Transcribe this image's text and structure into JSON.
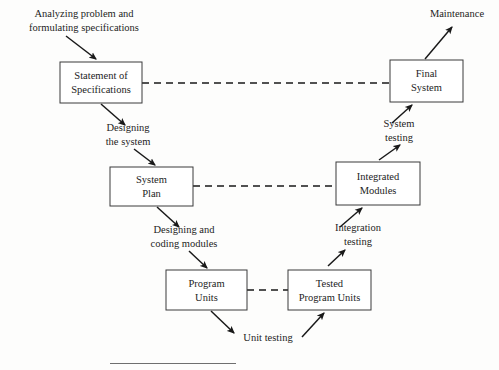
{
  "diagram": {
    "type": "flow-diagram",
    "colors": {
      "background": "#fdfdfc",
      "box_stroke": "#3a3a3a",
      "box_fill": "#ffffff",
      "text": "#1d1d1d",
      "arrow": "#191919"
    },
    "nodes": [
      {
        "id": "statement-of-specifications",
        "line1": "Statement of",
        "line2": "Specifications",
        "x": 60,
        "y": 62,
        "w": 82,
        "h": 41
      },
      {
        "id": "final-system",
        "line1": "Final",
        "line2": "System",
        "x": 390,
        "y": 60,
        "w": 73,
        "h": 42
      },
      {
        "id": "system-plan",
        "line1": "System",
        "line2": "Plan",
        "x": 110,
        "y": 167,
        "w": 83,
        "h": 39
      },
      {
        "id": "integrated-modules",
        "line1": "Integrated",
        "line2": "Modules",
        "x": 336,
        "y": 162,
        "w": 84,
        "h": 43
      },
      {
        "id": "program-units",
        "line1": "Program",
        "line2": "Units",
        "x": 166,
        "y": 270,
        "w": 81,
        "h": 40
      },
      {
        "id": "tested-program-units",
        "line1": "Tested",
        "line2": "Program Units",
        "x": 288,
        "y": 270,
        "w": 83,
        "h": 40
      }
    ],
    "edge_labels": [
      {
        "id": "analyzing-problem",
        "line1": "Analyzing problem and",
        "line2": "formulating specifications",
        "cx": 84,
        "y1": 17,
        "y2": 31
      },
      {
        "id": "designing-the-system",
        "line1": "Designing",
        "line2": "the system",
        "cx": 128,
        "y1": 131,
        "y2": 145
      },
      {
        "id": "designing-coding-modules",
        "line1": "Designing and",
        "line2": "coding modules",
        "cx": 184,
        "y1": 233,
        "y2": 247
      },
      {
        "id": "unit-testing",
        "line1": "Unit testing",
        "line2": "",
        "cx": 268,
        "y1": 341,
        "y2": 0
      },
      {
        "id": "integration-testing",
        "line1": "Integration",
        "line2": "testing",
        "cx": 358,
        "y1": 231,
        "y2": 245
      },
      {
        "id": "system-testing",
        "line1": "System",
        "line2": "testing",
        "cx": 399,
        "y1": 127,
        "y2": 141
      },
      {
        "id": "maintenance",
        "line1": "Maintenance",
        "line2": "",
        "cx": 457,
        "y1": 17,
        "y2": 0
      }
    ],
    "connections": [
      {
        "id": "spec-to-final",
        "style": "dashed"
      },
      {
        "id": "plan-to-integrated",
        "style": "dashed"
      },
      {
        "id": "program-to-tested",
        "style": "dashed"
      },
      {
        "id": "analyzing-to-spec",
        "style": "solid-arrow"
      },
      {
        "id": "spec-to-designing",
        "style": "solid-arrow"
      },
      {
        "id": "designing-to-plan",
        "style": "solid-arrow"
      },
      {
        "id": "plan-to-coding",
        "style": "solid-arrow"
      },
      {
        "id": "coding-to-program",
        "style": "solid-arrow"
      },
      {
        "id": "program-to-unit-testing",
        "style": "solid-arrow"
      },
      {
        "id": "unit-testing-to-tested",
        "style": "solid-arrow"
      },
      {
        "id": "tested-to-integration",
        "style": "solid-arrow"
      },
      {
        "id": "integration-to-integrated",
        "style": "solid-arrow"
      },
      {
        "id": "integrated-to-system-testing",
        "style": "solid-arrow"
      },
      {
        "id": "system-testing-to-final",
        "style": "solid-arrow"
      },
      {
        "id": "final-to-maintenance",
        "style": "solid-arrow"
      }
    ]
  }
}
